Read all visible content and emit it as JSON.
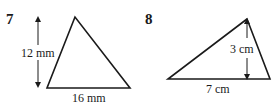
{
  "problems": [
    {
      "number": "7",
      "height_label": "12 mm",
      "base_label": "16 mm"
    },
    {
      "number": "8",
      "height_label": "3 cm",
      "base_label": "7 cm"
    }
  ],
  "colors": {
    "stroke": "#1a1a1a",
    "background": "#ffffff"
  }
}
